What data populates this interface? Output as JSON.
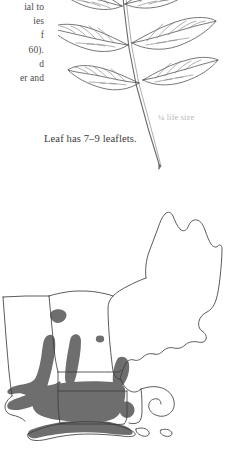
{
  "page": {
    "background_color": "#ffffff",
    "kind": "field-guide-page"
  },
  "body_text": {
    "lines": [
      "ial to",
      "ies",
      "f",
      "60).",
      "d",
      "er and"
    ]
  },
  "leaf_figure": {
    "caption": "Leaf has 7–9 leaflets.",
    "scale_label": "¼ life size",
    "scale_label_color": "#b9b9b9",
    "ink_color": "#555555",
    "leaflet_count_text": "7–9",
    "arrangement": "pinnately compound, opposite leaflet pairs"
  },
  "range_map": {
    "region": "New England",
    "outline_color": "#3d3d3d",
    "range_fill_color": "#6e6e6e",
    "background_color": "#ffffff",
    "states": [
      "Maine",
      "New Hampshire",
      "Vermont",
      "Massachusetts",
      "Rhode Island",
      "Connecticut",
      "New York"
    ],
    "shaded_areas": [
      "Connecticut",
      "Hudson Valley",
      "Long Island",
      "Narragansett Bay",
      "western Massachusetts",
      "southern Vermont"
    ]
  }
}
